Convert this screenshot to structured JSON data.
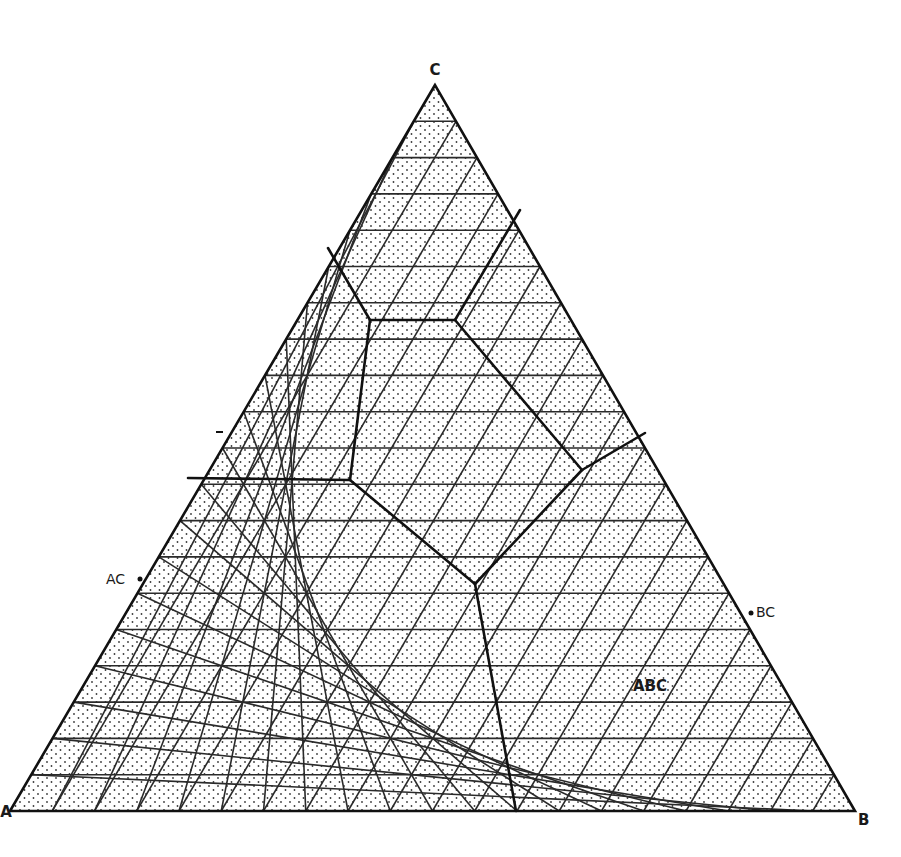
{
  "diagram": {
    "type": "ternary-phase-diagram",
    "grid_divisions": 20,
    "colors": {
      "background": "#ffffff",
      "ink": "#111111",
      "stipple": "#3a3a3a"
    },
    "vertices": {
      "top": {
        "label": "C",
        "x": 435,
        "y": 85
      },
      "left": {
        "label": "A",
        "x": 10,
        "y": 811
      },
      "right": {
        "label": "B",
        "x": 855,
        "y": 811
      }
    },
    "edge_labels": [
      {
        "label": "AC",
        "x": 106,
        "y": 584,
        "anchor": "end"
      },
      {
        "label": "BC",
        "x": 756,
        "y": 617,
        "anchor": "start"
      }
    ],
    "region_labels": [
      {
        "label": "ABC",
        "x": 650,
        "y": 691
      }
    ],
    "edge_ticks": [
      {
        "x": 221,
        "y": 432
      }
    ],
    "boundary_lines": [
      {
        "points": [
          [
            328,
            248
          ],
          [
            370,
            320
          ]
        ]
      },
      {
        "points": [
          [
            370,
            320
          ],
          [
            455,
            320
          ]
        ]
      },
      {
        "points": [
          [
            455,
            320
          ],
          [
            520,
            210
          ]
        ]
      },
      {
        "points": [
          [
            370,
            320
          ],
          [
            350,
            480
          ]
        ]
      },
      {
        "points": [
          [
            455,
            320
          ],
          [
            582,
            470
          ]
        ]
      },
      {
        "points": [
          [
            582,
            470
          ],
          [
            645,
            433
          ]
        ]
      },
      {
        "points": [
          [
            188,
            478
          ],
          [
            350,
            480
          ]
        ]
      },
      {
        "points": [
          [
            350,
            480
          ],
          [
            475,
            584
          ]
        ]
      },
      {
        "points": [
          [
            582,
            470
          ],
          [
            475,
            584
          ]
        ]
      },
      {
        "points": [
          [
            475,
            584
          ],
          [
            516,
            811
          ]
        ]
      }
    ]
  }
}
